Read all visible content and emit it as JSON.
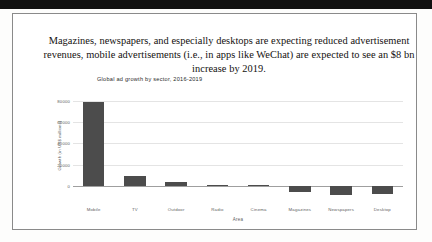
{
  "document": {
    "caption": "Magazines, newspapers, and especially desktops are expecting reduced advertisement revenues, mobile advertisements (i.e., in apps like WeChat) are expected to see an $8 bn increase by 2019."
  },
  "chart_data": {
    "type": "bar",
    "title": "Global ad growth by sector, 2016-2019",
    "xlabel": "Area",
    "ylabel": "Growth (in US$ millions)",
    "categories": [
      "Mobile",
      "TV",
      "Outdoor",
      "Radio",
      "Cinema",
      "Magazines",
      "Newspapers",
      "Desktop"
    ],
    "values": [
      79000,
      9500,
      4200,
      900,
      700,
      -5200,
      -8000,
      -7200
    ],
    "ylim": [
      -12000,
      88000
    ],
    "yticks": [
      80000,
      60000,
      40000,
      20000,
      0
    ],
    "ytick_labels": [
      "80000",
      "60000",
      "40000",
      "20000",
      "0"
    ],
    "grid": true,
    "legend": "none",
    "bar_color": "#4c4c4c"
  }
}
